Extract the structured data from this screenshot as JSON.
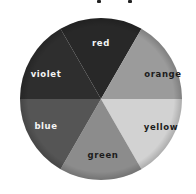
{
  "diagram": {
    "type": "color-wheel",
    "title": "",
    "slices": [
      {
        "label": "red",
        "fill": "#282828",
        "text_color": "#f4f4f4"
      },
      {
        "label": "orange",
        "fill": "#9b9b9b",
        "text_color": "#1c1c1c"
      },
      {
        "label": "yellow",
        "fill": "#d2d2d2",
        "text_color": "#1c1c1c"
      },
      {
        "label": "green",
        "fill": "#8c8c8c",
        "text_color": "#1c1c1c"
      },
      {
        "label": "blue",
        "fill": "#555555",
        "text_color": "#f4f4f4"
      },
      {
        "label": "violet",
        "fill": "#2e2e2e",
        "text_color": "#f4f4f4"
      }
    ]
  }
}
